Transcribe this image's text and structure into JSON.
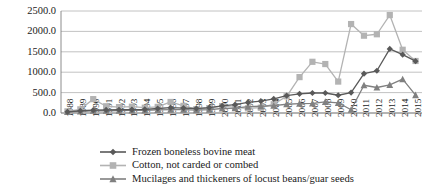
{
  "chart_data": {
    "type": "line",
    "title": "",
    "subtitle": "",
    "xlabel": "",
    "ylabel": "",
    "ylim": [
      0,
      2500
    ],
    "ytick_step": 500,
    "ytick_labels": [
      "0.0",
      "500.0",
      "1000.0",
      "1500.0",
      "2000.0",
      "2500.0"
    ],
    "grid": true,
    "legend_position": "bottom",
    "categories": [
      "1988",
      "1989",
      "1990",
      "1991",
      "1992",
      "1993",
      "1994",
      "1995",
      "1996",
      "1997",
      "1998",
      "1999",
      "2000",
      "2001",
      "2002",
      "2003",
      "2004",
      "2005",
      "2006",
      "2007",
      "2008",
      "2009",
      "2010",
      "2011",
      "2012",
      "2013",
      "2014",
      "2015"
    ],
    "series": [
      {
        "name": "Frozen boneless bovine meat",
        "color": "#595959",
        "marker": "diamond",
        "values": [
          30,
          55,
          70,
          75,
          80,
          85,
          90,
          110,
          130,
          120,
          110,
          130,
          175,
          205,
          260,
          290,
          345,
          425,
          470,
          490,
          490,
          435,
          500,
          965,
          1035,
          1570,
          1430,
          1270
        ]
      },
      {
        "name": "Cotton, not carded or combed",
        "color": "#b3b3b3",
        "marker": "square",
        "values": [
          40,
          90,
          340,
          165,
          145,
          155,
          130,
          150,
          270,
          175,
          95,
          120,
          170,
          140,
          115,
          130,
          215,
          410,
          880,
          1255,
          1200,
          770,
          2180,
          1895,
          1930,
          2400,
          1550,
          1275
        ]
      },
      {
        "name": "Mucilages and thickeners of locust beans/guar seeds",
        "color": "#808080",
        "marker": "triangle",
        "values": [
          25,
          40,
          55,
          55,
          60,
          65,
          65,
          75,
          85,
          85,
          70,
          85,
          110,
          120,
          155,
          165,
          180,
          215,
          230,
          235,
          275,
          250,
          80,
          680,
          625,
          690,
          830,
          440
        ]
      }
    ]
  },
  "legend": {
    "items": [
      {
        "label": "Frozen boneless bovine meat"
      },
      {
        "label": "Cotton, not carded or combed"
      },
      {
        "label": "Mucilages and thickeners of locust beans/guar seeds"
      }
    ]
  }
}
